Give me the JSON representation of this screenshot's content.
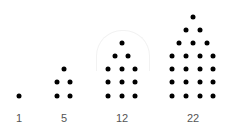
{
  "figures": [
    {
      "label": "1",
      "label_x": 19,
      "dots": [
        [
          19,
          96
        ]
      ]
    },
    {
      "label": "5",
      "label_x": 64,
      "dots": [
        [
          64,
          69
        ],
        [
          57,
          82
        ],
        [
          70,
          82
        ],
        [
          57,
          96
        ],
        [
          70,
          96
        ]
      ]
    },
    {
      "label": "12",
      "label_x": 122,
      "dots": [
        [
          122,
          43
        ],
        [
          115,
          56
        ],
        [
          128,
          56
        ],
        [
          108,
          69
        ],
        [
          122,
          69
        ],
        [
          135,
          69
        ],
        [
          108,
          82
        ],
        [
          122,
          82
        ],
        [
          135,
          82
        ],
        [
          108,
          96
        ],
        [
          122,
          96
        ],
        [
          135,
          96
        ]
      ]
    },
    {
      "label": "22",
      "label_x": 193,
      "dots": [
        [
          193,
          17
        ],
        [
          186,
          30
        ],
        [
          200,
          30
        ],
        [
          179,
          43
        ],
        [
          193,
          43
        ],
        [
          207,
          43
        ],
        [
          172,
          56
        ],
        [
          186,
          56
        ],
        [
          200,
          56
        ],
        [
          213,
          56
        ],
        [
          172,
          69
        ],
        [
          186,
          69
        ],
        [
          200,
          69
        ],
        [
          213,
          69
        ],
        [
          172,
          82
        ],
        [
          186,
          82
        ],
        [
          200,
          82
        ],
        [
          213,
          82
        ],
        [
          172,
          96
        ],
        [
          186,
          96
        ],
        [
          200,
          96
        ],
        [
          213,
          96
        ]
      ]
    }
  ],
  "colors": {
    "dot": "#000000",
    "label": "#555555",
    "background": "#ffffff"
  }
}
